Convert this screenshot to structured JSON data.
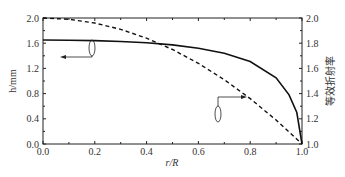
{
  "chart_data": {
    "type": "line",
    "title": "",
    "xlabel": "r/R",
    "ylabel_left": "h/mm",
    "ylabel_right": "等效折射率",
    "xlim": [
      0.0,
      1.0
    ],
    "ylim_left": [
      0.0,
      2.0
    ],
    "ylim_right": [
      1.0,
      2.0
    ],
    "x_ticks": [
      "0.0",
      "0.2",
      "0.4",
      "0.6",
      "0.8",
      "1.0"
    ],
    "y_left_ticks": [
      "0.0",
      "0.4",
      "0.8",
      "1.2",
      "1.6",
      "2.0"
    ],
    "y_right_ticks": [
      "1.0",
      "1.2",
      "1.4",
      "1.6",
      "1.8",
      "2.0"
    ],
    "grid": false,
    "series": [
      {
        "name": "h (thickness)",
        "axis": "left",
        "style": "solid",
        "x": [
          0.0,
          0.1,
          0.2,
          0.3,
          0.4,
          0.5,
          0.6,
          0.7,
          0.8,
          0.9,
          0.95,
          0.98,
          1.0
        ],
        "values": [
          1.65,
          1.648,
          1.641,
          1.628,
          1.607,
          1.573,
          1.52,
          1.44,
          1.31,
          1.05,
          0.78,
          0.5,
          0.0
        ]
      },
      {
        "name": "等效折射率",
        "axis": "right",
        "style": "dashed",
        "x": [
          0.0,
          0.1,
          0.2,
          0.3,
          0.4,
          0.5,
          0.6,
          0.7,
          0.8,
          0.9,
          1.0
        ],
        "values": [
          2.0,
          1.99,
          1.96,
          1.91,
          1.84,
          1.75,
          1.64,
          1.51,
          1.36,
          1.19,
          1.0
        ]
      }
    ],
    "annotations": [
      {
        "type": "arrow",
        "direction": "left",
        "series": "h (thickness)",
        "meaning": "left axis"
      },
      {
        "type": "arrow",
        "direction": "right",
        "series": "等效折射率",
        "meaning": "right axis"
      }
    ]
  },
  "axes": {
    "xlabel": "r/R",
    "ylabel_left": "h/mm",
    "ylabel_right": "等效折射率"
  }
}
